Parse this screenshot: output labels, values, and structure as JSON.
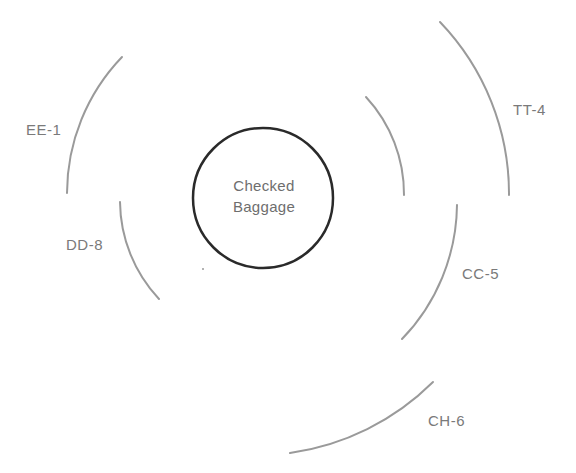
{
  "diagram": {
    "type": "radial-concentric-arcs",
    "center": {
      "label_line1": "Checked",
      "label_line2": "Baggage",
      "cx": 263,
      "cy": 198,
      "r": 70,
      "stroke_color": "#2a2a2a"
    },
    "arc_color": "#9a9a9a",
    "label_color": "#7a7a7a",
    "rings": [
      {
        "id": "EE-1",
        "label": "EE-1",
        "ring": 2,
        "side": "left-upper",
        "start": [
          122,
          57
        ],
        "end": [
          67,
          193
        ],
        "radius": 197,
        "label_pos": [
          26,
          122
        ]
      },
      {
        "id": "DD-8",
        "label": "DD-8",
        "ring": 1,
        "side": "left-lower",
        "start": [
          120,
          202
        ],
        "end": [
          159,
          299
        ],
        "radius": 144,
        "label_pos": [
          66,
          237
        ]
      },
      {
        "id": "inner-right",
        "label": "",
        "ring": 1,
        "side": "right-upper",
        "start": [
          366,
          97
        ],
        "end": [
          404,
          195
        ],
        "radius": 143
      },
      {
        "id": "TT-4",
        "label": "TT-4",
        "ring": 3,
        "side": "right-upper",
        "start": [
          440,
          22
        ],
        "end": [
          509,
          195
        ],
        "radius": 248,
        "label_pos": [
          513,
          102
        ]
      },
      {
        "id": "CC-5",
        "label": "CC-5",
        "ring": 2,
        "side": "right-lower",
        "start": [
          457,
          205
        ],
        "end": [
          402,
          339
        ],
        "radius": 196,
        "label_pos": [
          462,
          266
        ]
      },
      {
        "id": "CH-6",
        "label": "CH-6",
        "ring": 3,
        "side": "bottom-right",
        "start": [
          433,
          382
        ],
        "end": [
          290,
          453
        ],
        "radius": 252,
        "label_pos": [
          428,
          413
        ]
      }
    ]
  }
}
